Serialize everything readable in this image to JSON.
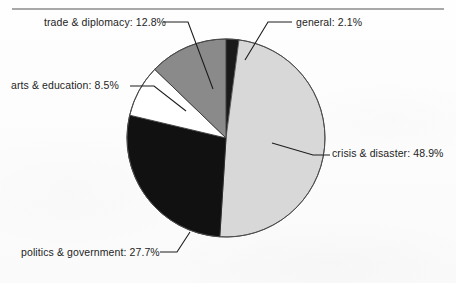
{
  "page": {
    "background_color": "#fdfdfd",
    "rule_color": "#a8a8a8",
    "label_text_color": "#1d1d1d"
  },
  "chart_data": {
    "type": "pie",
    "title": "",
    "subtitle": "",
    "xlabel": "",
    "ylabel": "",
    "legend_position": "none",
    "grid": false,
    "labels_format": "{category}: {value}%",
    "start_angle_deg": 0,
    "direction": "clockwise",
    "center": {
      "x": 226,
      "y": 138
    },
    "radius": 99,
    "categories": [
      "general",
      "crisis & disaster",
      "politics & government",
      "arts & education",
      "trade & diplomacy"
    ],
    "values": [
      2.1,
      48.9,
      27.7,
      8.5,
      12.8
    ],
    "slices": [
      {
        "category": "general",
        "value": 2.1,
        "label": "general: 2.1%",
        "color": "#1a1a1a",
        "start_angle_deg": 0.0,
        "end_angle_deg": 7.56
      },
      {
        "category": "crisis & disaster",
        "value": 48.9,
        "label": "crisis & disaster: 48.9%",
        "color": "#d8d8d8",
        "start_angle_deg": 7.56,
        "end_angle_deg": 183.6
      },
      {
        "category": "politics & government",
        "value": 27.7,
        "label": "politics & government: 27.7%",
        "color": "#111111",
        "start_angle_deg": 183.6,
        "end_angle_deg": 283.32
      },
      {
        "category": "arts & education",
        "value": 8.5,
        "label": "arts & education: 8.5%",
        "color": "#ffffff",
        "start_angle_deg": 283.32,
        "end_angle_deg": 313.92
      },
      {
        "category": "trade & diplomacy",
        "value": 12.8,
        "label": "trade & diplomacy: 12.8%",
        "color": "#8a8a8a",
        "start_angle_deg": 313.92,
        "end_angle_deg": 360.0
      }
    ]
  },
  "labels": {
    "trade": "trade & diplomacy: 12.8%",
    "general": "general: 2.1%",
    "arts": "arts & education: 8.5%",
    "crisis": "crisis & disaster: 48.9%",
    "politics": "politics & government: 27.7%"
  }
}
